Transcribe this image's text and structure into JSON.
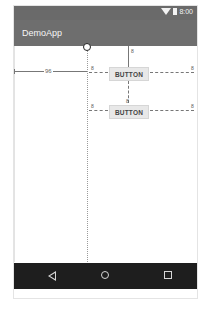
{
  "status_bar": {
    "time": "8:00",
    "icons": [
      "wifi-icon",
      "battery-icon"
    ]
  },
  "app_bar": {
    "title": "DemoApp"
  },
  "layout_editor": {
    "guideline": {
      "offset_label": "96"
    },
    "buttons": [
      {
        "label": "BUTTON",
        "margin_top": "8",
        "margin_left": "8",
        "margin_right": "8"
      },
      {
        "label": "BUTTON",
        "margin_top": "8",
        "margin_left": "8",
        "margin_right": "8"
      }
    ]
  },
  "nav_bar": {
    "buttons": [
      "back",
      "home",
      "recents"
    ]
  }
}
